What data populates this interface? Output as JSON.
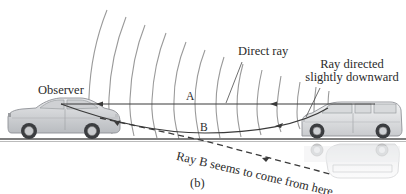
{
  "figure": {
    "panel_label": "(b)",
    "labels": {
      "observer": "Observer",
      "direct_ray": "Direct ray",
      "ray_directed_line1": "Ray directed",
      "ray_directed_line2": "slightly downward",
      "point_a": "A",
      "point_b": "B",
      "apparent_source": "Ray B seems to come from here"
    },
    "elements": {
      "observer_vehicle": "sedan",
      "source_vehicle": "minivan",
      "source_reflection": "minivan mirage image",
      "wavefronts": 14
    },
    "colors": {
      "ray": "#3a3a3a",
      "wavefront": "#9a9a9a",
      "road": "#555555",
      "car_body": "#d4d6d8",
      "text": "#2b2b2b"
    }
  }
}
